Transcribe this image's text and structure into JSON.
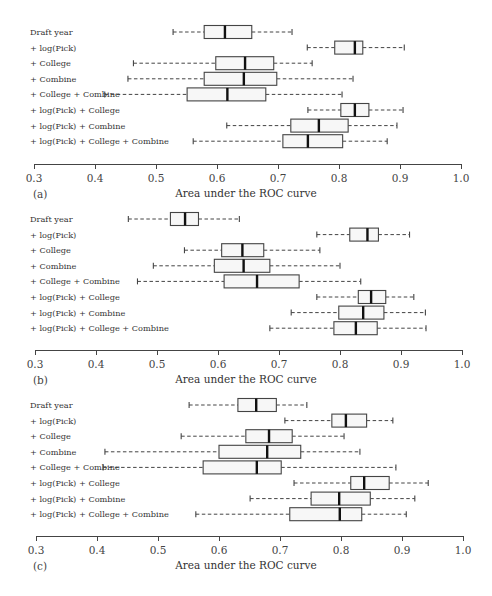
{
  "chart_data": [
    {
      "type": "boxplot",
      "panel_label": "(a)",
      "xlabel": "Area under the ROC curve",
      "xlim": [
        0.3,
        1.0
      ],
      "xticks": [
        "0.3",
        "0.4",
        "0.5",
        "0.6",
        "0.7",
        "0.8",
        "0.9",
        "1.0"
      ],
      "categories": [
        "Draft year",
        "+ log(Pick)",
        "+ College",
        "+ Combine",
        "+ College + Combine",
        "+ log(Pick) + College",
        "+ log(Pick) + Combine",
        "+ log(Pick) + College + Combine"
      ],
      "boxes": [
        {
          "min": 0.528,
          "q1": 0.579,
          "median": 0.613,
          "q3": 0.657,
          "max": 0.723
        },
        {
          "min": 0.748,
          "q1": 0.793,
          "median": 0.826,
          "q3": 0.839,
          "max": 0.907
        },
        {
          "min": 0.463,
          "q1": 0.598,
          "median": 0.646,
          "q3": 0.693,
          "max": 0.756
        },
        {
          "min": 0.454,
          "q1": 0.579,
          "median": 0.644,
          "q3": 0.698,
          "max": 0.823
        },
        {
          "min": 0.416,
          "q1": 0.551,
          "median": 0.617,
          "q3": 0.68,
          "max": 0.805
        },
        {
          "min": 0.749,
          "q1": 0.803,
          "median": 0.826,
          "q3": 0.849,
          "max": 0.905
        },
        {
          "min": 0.616,
          "q1": 0.721,
          "median": 0.767,
          "q3": 0.815,
          "max": 0.895
        },
        {
          "min": 0.561,
          "q1": 0.708,
          "median": 0.749,
          "q3": 0.806,
          "max": 0.879
        }
      ]
    },
    {
      "type": "boxplot",
      "panel_label": "(b)",
      "xlabel": "Area under the ROC curve",
      "xlim": [
        0.3,
        1.0
      ],
      "xticks": [
        "0.3",
        "0.4",
        "0.5",
        "0.6",
        "0.7",
        "0.8",
        "0.9",
        "1.0"
      ],
      "categories": [
        "Draft year",
        "+ log(Pick)",
        "+ College",
        "+ Combine",
        "+ College + Combine",
        "+ log(Pick) + College",
        "+ log(Pick) + Combine",
        "+ log(Pick) + College + Combine"
      ],
      "boxes": [
        {
          "min": 0.453,
          "q1": 0.522,
          "median": 0.546,
          "q3": 0.568,
          "max": 0.635
        },
        {
          "min": 0.762,
          "q1": 0.816,
          "median": 0.845,
          "q3": 0.863,
          "max": 0.914
        },
        {
          "min": 0.545,
          "q1": 0.606,
          "median": 0.64,
          "q3": 0.675,
          "max": 0.767
        },
        {
          "min": 0.494,
          "q1": 0.594,
          "median": 0.642,
          "q3": 0.685,
          "max": 0.8
        },
        {
          "min": 0.468,
          "q1": 0.61,
          "median": 0.664,
          "q3": 0.733,
          "max": 0.834
        },
        {
          "min": 0.762,
          "q1": 0.83,
          "median": 0.851,
          "q3": 0.875,
          "max": 0.921
        },
        {
          "min": 0.72,
          "q1": 0.798,
          "median": 0.838,
          "q3": 0.872,
          "max": 0.94
        },
        {
          "min": 0.685,
          "q1": 0.79,
          "median": 0.826,
          "q3": 0.861,
          "max": 0.941
        }
      ]
    },
    {
      "type": "boxplot",
      "panel_label": "(c)",
      "xlabel": "Area under the ROC curve",
      "xlim": [
        0.3,
        1.0
      ],
      "xticks": [
        "0.3",
        "0.4",
        "0.5",
        "0.6",
        "0.7",
        "0.8",
        "0.9",
        "1.0"
      ],
      "categories": [
        "Draft year",
        "+ log(Pick)",
        "+ College",
        "+ Combine",
        "+ College + Combine",
        "+ log(Pick) + College",
        "+ log(Pick) + Combine",
        "+ log(Pick) + College + Combine"
      ],
      "boxes": [
        {
          "min": 0.551,
          "q1": 0.631,
          "median": 0.661,
          "q3": 0.694,
          "max": 0.744
        },
        {
          "min": 0.708,
          "q1": 0.785,
          "median": 0.808,
          "q3": 0.842,
          "max": 0.885
        },
        {
          "min": 0.538,
          "q1": 0.644,
          "median": 0.682,
          "q3": 0.72,
          "max": 0.805
        },
        {
          "min": 0.413,
          "q1": 0.6,
          "median": 0.679,
          "q3": 0.734,
          "max": 0.831
        },
        {
          "min": 0.41,
          "q1": 0.574,
          "median": 0.662,
          "q3": 0.702,
          "max": 0.89
        },
        {
          "min": 0.723,
          "q1": 0.816,
          "median": 0.838,
          "q3": 0.879,
          "max": 0.943
        },
        {
          "min": 0.651,
          "q1": 0.751,
          "median": 0.797,
          "q3": 0.848,
          "max": 0.921
        },
        {
          "min": 0.562,
          "q1": 0.716,
          "median": 0.798,
          "q3": 0.834,
          "max": 0.907
        }
      ]
    }
  ],
  "style": {
    "box_fill": "#f7f7f7",
    "box_stroke": "#444444",
    "median_color": "#111111",
    "whisker_color": "#444444"
  }
}
